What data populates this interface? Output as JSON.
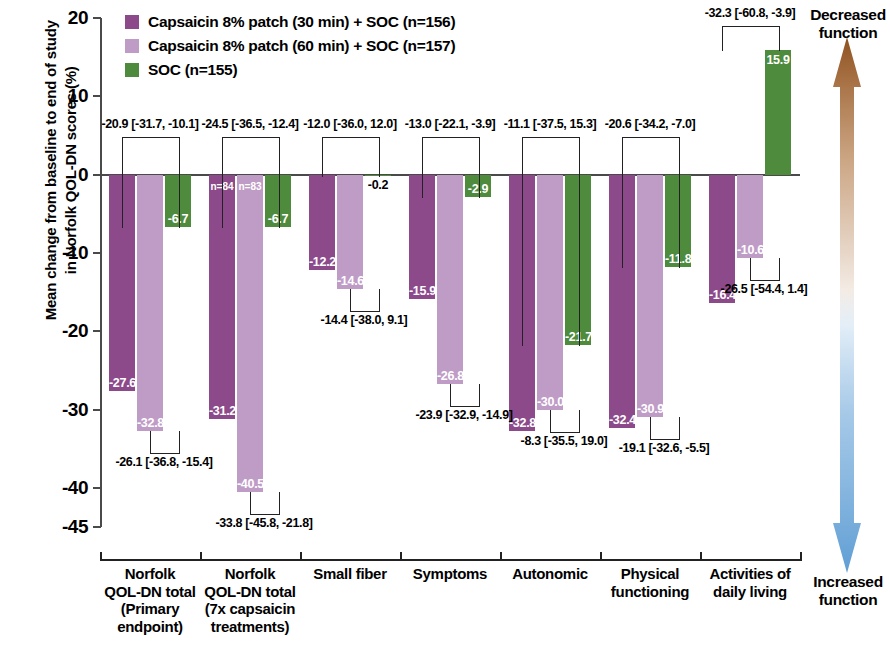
{
  "axis": {
    "y_title": "Mean change from baseline to end of study\nin Norfolk QOL-DN scores (%)",
    "y_ticks": [
      "20",
      "10",
      "0",
      "-10",
      "-20",
      "-30",
      "-40",
      "-45"
    ]
  },
  "legend": {
    "items": [
      {
        "label": "Capsaicin 8% patch (30 min) + SOC (n=156)",
        "color": "#8d4a8a"
      },
      {
        "label": "Capsaicin 8% patch (60 min) + SOC (n=157)",
        "color": "#bf9cc6"
      },
      {
        "label": "SOC (n=155)",
        "color": "#4e8b3c"
      }
    ]
  },
  "side": {
    "top_label": "Decreased\nfunction",
    "bottom_label": "Increased\nfunction",
    "up_color": "#9c5a22",
    "down_color": "#6aa5d8"
  },
  "chart_data": {
    "type": "bar",
    "title": "",
    "xlabel": "",
    "ylabel": "Mean change from baseline to end of study in Norfolk QOL-DN scores (%)",
    "ylim": [
      -45,
      20
    ],
    "yticks": [
      20,
      10,
      0,
      -10,
      -20,
      -30,
      -40,
      -45
    ],
    "grid": false,
    "legend_position": "top-left",
    "categories": [
      "Norfolk QOL-DN total (Primary endpoint)",
      "Norfolk QOL-DN total (7x capsaicin treatments)",
      "Small fiber",
      "Symptoms",
      "Autonomic",
      "Physical functioning",
      "Activities of daily living"
    ],
    "category_lines": [
      [
        "Norfolk",
        "QOL-DN total",
        "(Primary",
        "endpoint)"
      ],
      [
        "Norfolk",
        "QOL-DN total",
        "(7x capsaicin",
        "treatments)"
      ],
      [
        "Small fiber"
      ],
      [
        "Symptoms"
      ],
      [
        "Autonomic"
      ],
      [
        "Physical",
        "functioning"
      ],
      [
        "Activities of",
        "daily living"
      ]
    ],
    "series": [
      {
        "name": "Capsaicin 8% patch (30 min) + SOC (n=156)",
        "color": "#8d4a8a",
        "values": [
          -27.6,
          -31.2,
          -12.2,
          -15.9,
          -32.8,
          -32.4,
          -16.4
        ]
      },
      {
        "name": "Capsaicin 8% patch (60 min) + SOC (n=157)",
        "color": "#bf9cc6",
        "values": [
          -32.8,
          -40.5,
          -14.6,
          -26.8,
          -30.0,
          -30.9,
          -10.6
        ]
      },
      {
        "name": "SOC (n=155)",
        "color": "#4e8b3c",
        "values": [
          -6.7,
          -6.7,
          -0.2,
          -2.9,
          -21.7,
          -11.8,
          15.9
        ]
      }
    ],
    "bar_labels": [
      [
        "-27.6",
        "-32.8",
        "-6.7"
      ],
      [
        "-31.2",
        "-40.5",
        "-6.7"
      ],
      [
        "-12.2",
        "-14.6",
        "-0.2"
      ],
      [
        "-15.9",
        "-26.8",
        "-2.9"
      ],
      [
        "-32.8",
        "-30.0",
        "-21.7"
      ],
      [
        "-32.4",
        "-30.9",
        "-11.8"
      ],
      [
        "-16.4",
        "-10.6",
        "15.9"
      ]
    ],
    "n_annotations": {
      "group": "Norfolk QOL-DN total (7x capsaicin treatments)",
      "labels": [
        "n=84",
        "n=83"
      ]
    },
    "comparisons": [
      {
        "group": "Norfolk QOL-DN total (Primary endpoint)",
        "top": {
          "text": "-20.9 [-31.7, -10.1]",
          "bars": [
            0,
            2
          ]
        },
        "bottom": {
          "text": "-26.1 [-36.8, -15.4]",
          "bars": [
            1,
            2
          ]
        }
      },
      {
        "group": "Norfolk QOL-DN total (7x capsaicin treatments)",
        "top": {
          "text": "-24.5 [-36.5, -12.4]",
          "bars": [
            0,
            2
          ]
        },
        "bottom": {
          "text": "-33.8 [-45.8, -21.8]",
          "bars": [
            1,
            2
          ]
        }
      },
      {
        "group": "Small fiber",
        "top": {
          "text": "-12.0 [-36.0, 12.0]",
          "bars": [
            0,
            2
          ]
        },
        "bottom": {
          "text": "-14.4 [-38.0, 9.1]",
          "bars": [
            1,
            2
          ]
        }
      },
      {
        "group": "Symptoms",
        "top": {
          "text": "-13.0 [-22.1, -3.9]",
          "bars": [
            0,
            2
          ]
        },
        "bottom": {
          "text": "-23.9 [-32.9, -14.9]",
          "bars": [
            1,
            2
          ]
        }
      },
      {
        "group": "Autonomic",
        "top": {
          "text": "-11.1 [-37.5, 15.3]",
          "bars": [
            0,
            2
          ]
        },
        "bottom": {
          "text": "-8.3 [-35.5, 19.0]",
          "bars": [
            1,
            2
          ]
        }
      },
      {
        "group": "Physical functioning",
        "top": {
          "text": "-20.6 [-34.2, -7.0]",
          "bars": [
            0,
            2
          ]
        },
        "bottom": {
          "text": "-19.1 [-32.6, -5.5]",
          "bars": [
            1,
            2
          ]
        }
      },
      {
        "group": "Activities of daily living",
        "top": {
          "text": "-32.3 [-60.8, -3.9]",
          "bars": [
            0,
            2
          ]
        },
        "bottom": {
          "text": "-26.5 [-54.4, 1.4]",
          "bars": [
            1,
            2
          ]
        }
      }
    ]
  }
}
